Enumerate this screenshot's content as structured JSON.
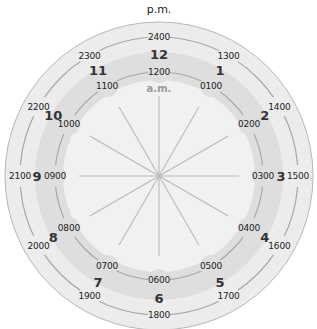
{
  "title_pm": "p.m.",
  "label_am": "a.m.",
  "colors": {
    "outer_ring": "#ececec",
    "band": "#dedede",
    "inner_disc": "#f1f1f1",
    "lines": "#a8a8a8",
    "spokes": "#b9b9b9"
  },
  "hours": [
    {
      "hour": "12",
      "am": "1200",
      "pm": "2400"
    },
    {
      "hour": "1",
      "am": "0100",
      "pm": "1300"
    },
    {
      "hour": "2",
      "am": "0200",
      "pm": "1400"
    },
    {
      "hour": "3",
      "am": "0300",
      "pm": "1500"
    },
    {
      "hour": "4",
      "am": "0400",
      "pm": "1600"
    },
    {
      "hour": "5",
      "am": "0500",
      "pm": "1700"
    },
    {
      "hour": "6",
      "am": "0600",
      "pm": "1800"
    },
    {
      "hour": "7",
      "am": "0700",
      "pm": "1900"
    },
    {
      "hour": "8",
      "am": "0800",
      "pm": "2000"
    },
    {
      "hour": "9",
      "am": "0900",
      "pm": "2100"
    },
    {
      "hour": "10",
      "am": "1000",
      "pm": "2200"
    },
    {
      "hour": "11",
      "am": "1100",
      "pm": "2300"
    }
  ]
}
